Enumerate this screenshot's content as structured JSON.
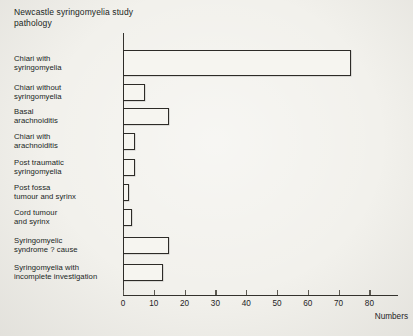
{
  "header": {
    "title_line1": "Newcastle syringomyelia study",
    "title_line2": "pathology"
  },
  "chart_data": {
    "type": "bar",
    "orientation": "horizontal",
    "title": "Newcastle syringomyelia study pathology",
    "categories": [
      "Chiari with syringomyelia",
      "Chiari without syringomyelia",
      "Basal arachnoiditis",
      "Chiari with arachnoiditis",
      "Post traumatic syringomyelia",
      "Post fossa tumour and syrinx",
      "Cord tumour and syrinx",
      "Syringomyelic syndrome ? cause",
      "Syringomyelia with incomplete investigation"
    ],
    "category_lines": [
      [
        "Chiari with",
        "syringomyelia"
      ],
      [
        "Chiari without",
        "syringomyelia"
      ],
      [
        "Basal",
        "arachnoiditis"
      ],
      [
        "Chiari with",
        "arachnoiditis"
      ],
      [
        "Post traumatic",
        "syringomyelia"
      ],
      [
        "Post fossa",
        "tumour and syrinx"
      ],
      [
        "Cord tumour",
        "and syrinx"
      ],
      [
        "Syringomyelic",
        "syndrome ? cause"
      ],
      [
        "Syringomyelia with",
        "incomplete investigation"
      ]
    ],
    "values": [
      74,
      7,
      15,
      4,
      4,
      2,
      3,
      15,
      13
    ],
    "xlabel": "Numbers",
    "xticks": [
      0,
      10,
      20,
      30,
      40,
      50,
      60,
      70,
      80
    ],
    "xlim": [
      0,
      90
    ],
    "grid": false,
    "legend": "none",
    "bar_style": "outlined-unfilled",
    "colors": {
      "line": "#2d2b27",
      "background": "#f2f1ec",
      "bar_fill": "#f6f5f0",
      "text": "#201f1d"
    }
  }
}
